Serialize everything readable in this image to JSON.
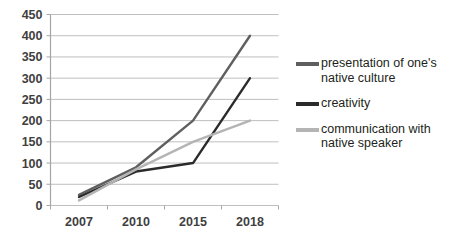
{
  "chart_data": {
    "type": "line",
    "title": "",
    "xlabel": "",
    "ylabel": "",
    "categories": [
      "2007",
      "2010",
      "2015",
      "2018"
    ],
    "ylim": [
      0,
      450
    ],
    "yticks": [
      0,
      50,
      100,
      150,
      200,
      250,
      300,
      350,
      400,
      450
    ],
    "ytick_labels": [
      "0",
      "50",
      "100",
      "150",
      "200",
      "250",
      "300",
      "350",
      "400",
      "450"
    ],
    "grid": "horizontal",
    "legend_position": "right",
    "series": [
      {
        "name": "presentation of one's native culture",
        "color": "#5f5f5f",
        "values": [
          25,
          90,
          200,
          400
        ]
      },
      {
        "name": "creativity",
        "color": "#2b2b2b",
        "values": [
          20,
          80,
          100,
          300
        ]
      },
      {
        "name": "communication with native speaker",
        "color": "#b4b4b4",
        "values": [
          12,
          85,
          150,
          200
        ]
      }
    ]
  },
  "legend": {
    "items": [
      {
        "label": "presentation of one's\nnative culture",
        "color": "#5f5f5f"
      },
      {
        "label": "creativity",
        "color": "#2b2b2b"
      },
      {
        "label": "communication with\nnative speaker",
        "color": "#b4b4b4"
      }
    ]
  },
  "axis": {
    "line_color": "#a6a6a6",
    "grid_color": "#bfbfbf"
  }
}
